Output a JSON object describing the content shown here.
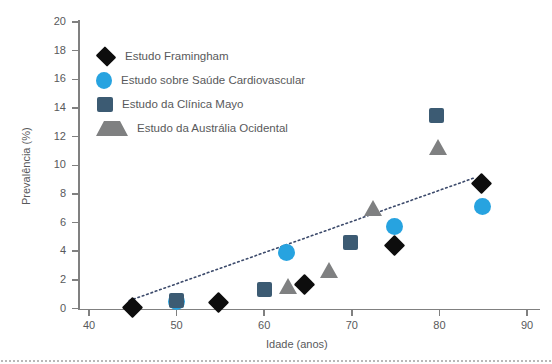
{
  "chart_data": {
    "type": "scatter",
    "title": "",
    "xlabel": "Idade (anos)",
    "ylabel": "Prevalência (%)",
    "xlim": [
      37,
      92
    ],
    "ylim": [
      0,
      20
    ],
    "xticks": [
      40,
      50,
      60,
      70,
      80,
      90
    ],
    "yticks": [
      0,
      2,
      4,
      6,
      8,
      10,
      12,
      14,
      16,
      18,
      20
    ],
    "grid": false,
    "legend_position": "upper-left-inside",
    "series": [
      {
        "name": "Estudo Framingham",
        "marker": "diamond",
        "color": "#0d0d0d",
        "points": [
          {
            "x": 45.0,
            "y": 0.1
          },
          {
            "x": 54.8,
            "y": 0.4
          },
          {
            "x": 64.6,
            "y": 1.7
          },
          {
            "x": 74.9,
            "y": 4.4
          },
          {
            "x": 84.8,
            "y": 8.7
          }
        ]
      },
      {
        "name": "Estudo sobre Saúde Cardiovascular",
        "marker": "circle",
        "color": "#27a3e0",
        "points": [
          {
            "x": 50.0,
            "y": 0.5
          },
          {
            "x": 62.5,
            "y": 3.9
          },
          {
            "x": 74.9,
            "y": 5.7
          },
          {
            "x": 84.9,
            "y": 7.1
          }
        ]
      },
      {
        "name": "Estudo da Clínica Mayo",
        "marker": "square",
        "color": "#3c5b73",
        "points": [
          {
            "x": 50.0,
            "y": 0.55
          },
          {
            "x": 60.0,
            "y": 1.3
          },
          {
            "x": 69.8,
            "y": 4.6
          },
          {
            "x": 79.7,
            "y": 13.5
          }
        ]
      },
      {
        "name": "Estudo da Austrália Ocidental",
        "marker": "triangle",
        "color": "#7f8081",
        "points": [
          {
            "x": 62.7,
            "y": 1.6
          },
          {
            "x": 67.4,
            "y": 2.7
          },
          {
            "x": 72.4,
            "y": 7.0
          },
          {
            "x": 79.8,
            "y": 11.3
          }
        ]
      }
    ],
    "trendline": {
      "style": "dotted",
      "color": "#3c4a6b",
      "start": {
        "x": 44.6,
        "y": 0.55
      },
      "end": {
        "x": 83.9,
        "y": 9.1
      }
    }
  },
  "axis": {
    "y_title": "Prevalência (%)",
    "x_title": "Idade (anos)",
    "y_tick_labels": [
      "20",
      "18",
      "16",
      "14",
      "12",
      "10",
      "8",
      "6",
      "4",
      "2",
      "0"
    ],
    "x_tick_labels": [
      "40",
      "50",
      "60",
      "70",
      "80",
      "90"
    ]
  },
  "legend": {
    "items": [
      {
        "label": "Estudo Framingham",
        "marker": "diamond-marker-icon"
      },
      {
        "label": "Estudo sobre Saúde Cardiovascular",
        "marker": "circle-marker-icon"
      },
      {
        "label": "Estudo da Clínica Mayo",
        "marker": "square-marker-icon"
      },
      {
        "label": "Estudo da Austrália Ocidental",
        "marker": "triangle-marker-icon"
      }
    ]
  },
  "colors": {
    "framingham": "#0d0d0d",
    "cardiovascular": "#27a3e0",
    "mayo": "#3c5b73",
    "australia": "#7f8081",
    "axis": "#808080",
    "text": "#58595b",
    "trend": "#3c4a6b"
  }
}
